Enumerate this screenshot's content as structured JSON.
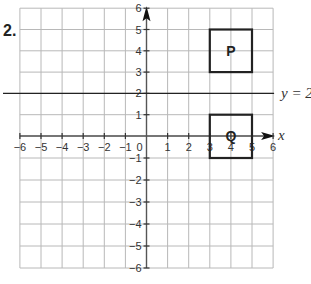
{
  "question": {
    "number": "2."
  },
  "grid": {
    "x_min": -6,
    "x_max": 6,
    "y_min": -6,
    "y_max": 6,
    "origin_px": {
      "x": 146.5,
      "y": 136
    },
    "unit_px_x": 21.1,
    "unit_px_y_up": 21.3,
    "unit_px_y_down": 22.0,
    "gridline_color": "#b8b8b8",
    "axis_color": "#555555"
  },
  "axes": {
    "x_label": "x",
    "y_label": "y",
    "origin_label": "0",
    "x_ticks": [
      "-6",
      "-5",
      "-4",
      "-3",
      "-2",
      "-1",
      "1",
      "2",
      "3",
      "4",
      "5",
      "6"
    ],
    "y_ticks": [
      "6",
      "5",
      "4",
      "3",
      "2",
      "1",
      "-1",
      "-2",
      "-3",
      "-4",
      "-5",
      "-6"
    ]
  },
  "mirror_line": {
    "equation_label": "y = 2",
    "y_value": 2
  },
  "shapes": [
    {
      "label": "P",
      "x1": 3,
      "y1": 3,
      "x2": 5,
      "y2": 5
    },
    {
      "label": "Q",
      "x1": 3,
      "y1": -1,
      "x2": 5,
      "y2": 1
    }
  ]
}
